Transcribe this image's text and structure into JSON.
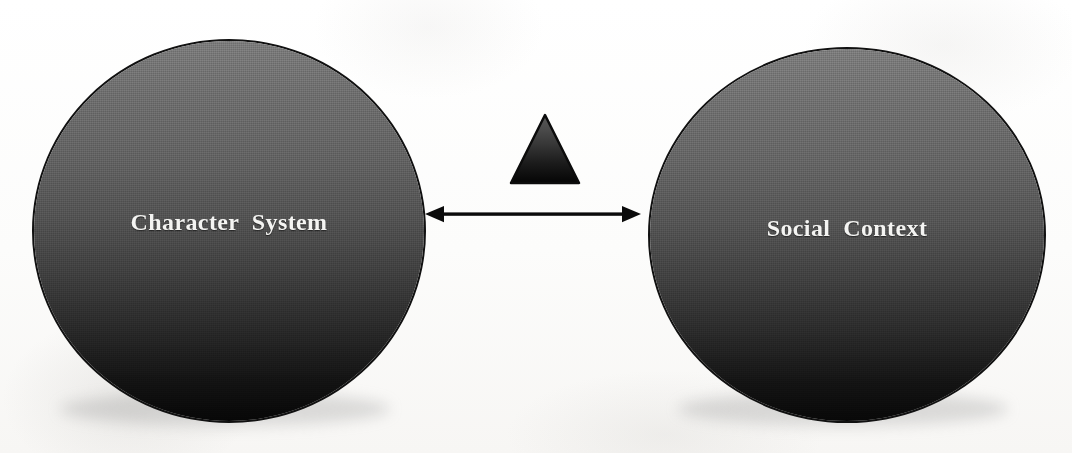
{
  "diagram": {
    "background_color": "#ffffff",
    "nodes": [
      {
        "id": "character-system",
        "label": "Character  System",
        "shape": "circle",
        "text_color": "#f4f4f2",
        "fill_top_color": "#7b7b7b",
        "fill_bottom_color": "#070707",
        "outline_color": "#111111"
      },
      {
        "id": "social-context",
        "label": "Social  Context",
        "shape": "circle",
        "text_color": "#f4f4f2",
        "fill_top_color": "#7c7c7c",
        "fill_bottom_color": "#080808",
        "outline_color": "#111111"
      },
      {
        "id": "triangle",
        "label": "",
        "shape": "triangle",
        "fill_top_color": "#4f4f4f",
        "fill_bottom_color": "#050505",
        "outline_color": "#0c0c0c"
      }
    ],
    "connectors": [
      {
        "id": "character-system-social-context",
        "type": "double-headed-arrow",
        "from": "character-system",
        "to": "social-context",
        "label": "",
        "color": "#0b0b0b"
      }
    ]
  }
}
